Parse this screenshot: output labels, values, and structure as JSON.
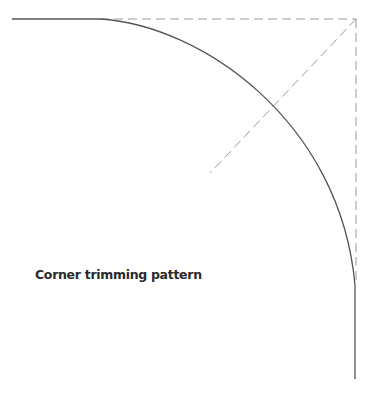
{
  "diagram": {
    "caption": "Corner trimming pattern",
    "colors": {
      "solid_line": "#555555",
      "dashed_line": "#9a9a9a",
      "text": "#2a2a2a"
    },
    "elements": [
      {
        "type": "solid-line",
        "name": "top-edge",
        "from": [
          12,
          19
        ],
        "to": [
          100,
          19
        ]
      },
      {
        "type": "arc",
        "name": "trimmed-corner-curve",
        "from": [
          100,
          19
        ],
        "to": [
          355,
          285
        ]
      },
      {
        "type": "solid-line",
        "name": "right-edge",
        "from": [
          355,
          285
        ],
        "to": [
          355,
          379
        ]
      },
      {
        "type": "dashed-line",
        "name": "original-top-edge",
        "from": [
          100,
          19
        ],
        "to": [
          356,
          19
        ]
      },
      {
        "type": "dashed-line",
        "name": "original-right-edge",
        "from": [
          356,
          19
        ],
        "to": [
          356,
          285
        ]
      },
      {
        "type": "dashed-line",
        "name": "corner-diagonal",
        "from": [
          356,
          19
        ],
        "to": [
          210,
          173
        ]
      }
    ]
  }
}
